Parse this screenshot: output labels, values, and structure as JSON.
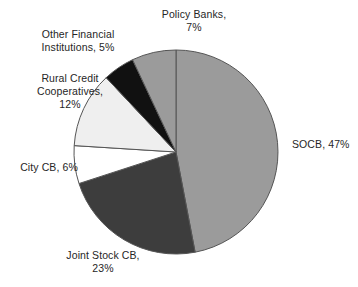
{
  "chart_data": {
    "type": "pie",
    "title": "",
    "subtitle": "",
    "xlabel": "",
    "ylabel": "",
    "legend_position": "none",
    "grid": false,
    "start_angle_deg": 0,
    "direction": "clockwise",
    "unit": "%",
    "categories": [
      "SOCB",
      "Joint Stock CB",
      "City CB",
      "Rural Credit Cooperatives",
      "Other Financial Institutions",
      "Policy Banks"
    ],
    "values": [
      47,
      23,
      6,
      12,
      5,
      7
    ],
    "colors": [
      "#9b9b9b",
      "#3d3d3d",
      "#ffffff",
      "#efefef",
      "#111111",
      "#9b9b9b"
    ],
    "slices": [
      {
        "name": "SOCB",
        "value": 47,
        "label": "SOCB, 47%",
        "color": "#9b9b9b",
        "label_lines": [
          "SOCB, 47%"
        ]
      },
      {
        "name": "Joint Stock CB",
        "value": 23,
        "label": "Joint Stock CB, 23%",
        "color": "#3d3d3d",
        "label_lines": [
          "Joint Stock CB,",
          "23%"
        ]
      },
      {
        "name": "City CB",
        "value": 6,
        "label": "City CB, 6%",
        "color": "#ffffff",
        "label_lines": [
          "City CB, 6%"
        ]
      },
      {
        "name": "Rural Credit Cooperatives",
        "value": 12,
        "label": "Rural Credit Cooperatives, 12%",
        "color": "#efefef",
        "label_lines": [
          "Rural Credit",
          "Cooperatives,",
          "12%"
        ]
      },
      {
        "name": "Other Financial Institutions",
        "value": 5,
        "label": "Other Financial Institutions, 5%",
        "color": "#111111",
        "label_lines": [
          "Other Financial",
          "Institutions, 5%"
        ]
      },
      {
        "name": "Policy Banks",
        "value": 7,
        "label": "Policy Banks, 7%",
        "color": "#9b9b9b",
        "label_lines": [
          "Policy Banks,",
          "7%"
        ]
      }
    ],
    "annotations": []
  },
  "labels": {
    "socb": "SOCB, 47%",
    "joint_stock_cb": "Joint Stock CB,\n23%",
    "city_cb": "City CB, 6%",
    "rural_credit": "Rural Credit\nCooperatives,\n12%",
    "other_financial": "Other Financial\nInstitutions, 5%",
    "policy_banks": "Policy Banks,\n7%"
  },
  "geometry": {
    "center_x": 176,
    "center_y": 152,
    "radius": 102
  },
  "style": {
    "background": "#ffffff",
    "outline": "#555555",
    "text_color": "#262626"
  }
}
